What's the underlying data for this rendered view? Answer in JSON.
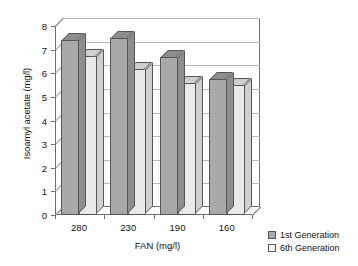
{
  "chart_data": {
    "type": "bar",
    "title": "",
    "xlabel": "FAN (mg/l)",
    "ylabel": "Isoamyl acetate (mg/l)",
    "categories": [
      "280",
      "230",
      "190",
      "160"
    ],
    "series": [
      {
        "name": "1st Generation",
        "values": [
          7.4,
          7.5,
          6.7,
          5.75
        ],
        "color": "#a9a9a9"
      },
      {
        "name": "6th Generation",
        "values": [
          6.75,
          6.2,
          5.6,
          5.5
        ],
        "color": "#e9e9e9"
      }
    ],
    "ylim": [
      0,
      8
    ],
    "yticks": [
      "0",
      "1",
      "2",
      "3",
      "4",
      "5",
      "6",
      "7",
      "8"
    ],
    "grid": true,
    "legend_position": "bottom-right",
    "style": "3d-column"
  },
  "legend": {
    "items": [
      {
        "label": "1st Generation"
      },
      {
        "label": "6th Generation"
      }
    ]
  }
}
